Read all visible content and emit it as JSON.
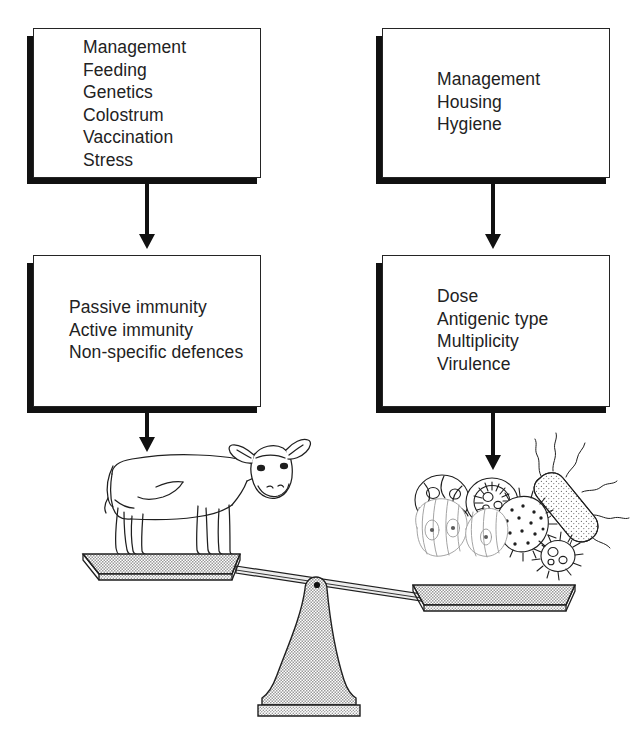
{
  "figure": {
    "kind": "flow-diagram-with-balance-illustration"
  },
  "boxes": {
    "host_factors": {
      "name": "host-factors-box",
      "lines": "Management\nFeeding\nGenetics\nColostrum\nVaccination\nStress"
    },
    "environment_factors": {
      "name": "environment-factors-box",
      "lines": "Management\nHousing\nHygiene"
    },
    "host_defences": {
      "name": "host-defences-box",
      "lines": "Passive immunity\nActive immunity\nNon-specific defences"
    },
    "pathogen_factors": {
      "name": "pathogen-factors-box",
      "lines": "Dose\nAntigenic type\nMultiplicity\nVirulence"
    }
  },
  "illustration": {
    "left_pan_subject": "calf",
    "right_pan_subject": "micro-organisms",
    "fulcrum": "balance-stand",
    "tilt": "right side down"
  },
  "colors": {
    "ink": "#222222",
    "shadow": "#111111",
    "pan_fill": "#d9d9d9",
    "stand_fill": "#d4d4d4",
    "paper": "#ffffff"
  }
}
